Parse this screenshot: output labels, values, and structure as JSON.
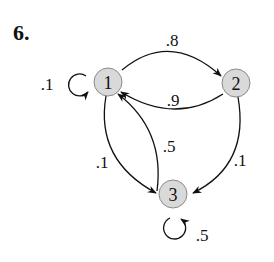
{
  "problem": {
    "number": "6."
  },
  "nodes": [
    {
      "id": "1",
      "label": "1"
    },
    {
      "id": "2",
      "label": "2"
    },
    {
      "id": "3",
      "label": "3"
    }
  ],
  "edges": [
    {
      "from": "1",
      "to": "1",
      "label": ".1"
    },
    {
      "from": "1",
      "to": "2",
      "label": ".8"
    },
    {
      "from": "2",
      "to": "1",
      "label": ".9"
    },
    {
      "from": "1",
      "to": "3",
      "label": ".1"
    },
    {
      "from": "3",
      "to": "1",
      "label": ".5"
    },
    {
      "from": "2",
      "to": "3",
      "label": ".1"
    },
    {
      "from": "3",
      "to": "3",
      "label": ".5"
    }
  ],
  "colors": {
    "node_fill": "#d9d9d9",
    "node_stroke": "#8a8a8a",
    "ink": "#111111"
  }
}
